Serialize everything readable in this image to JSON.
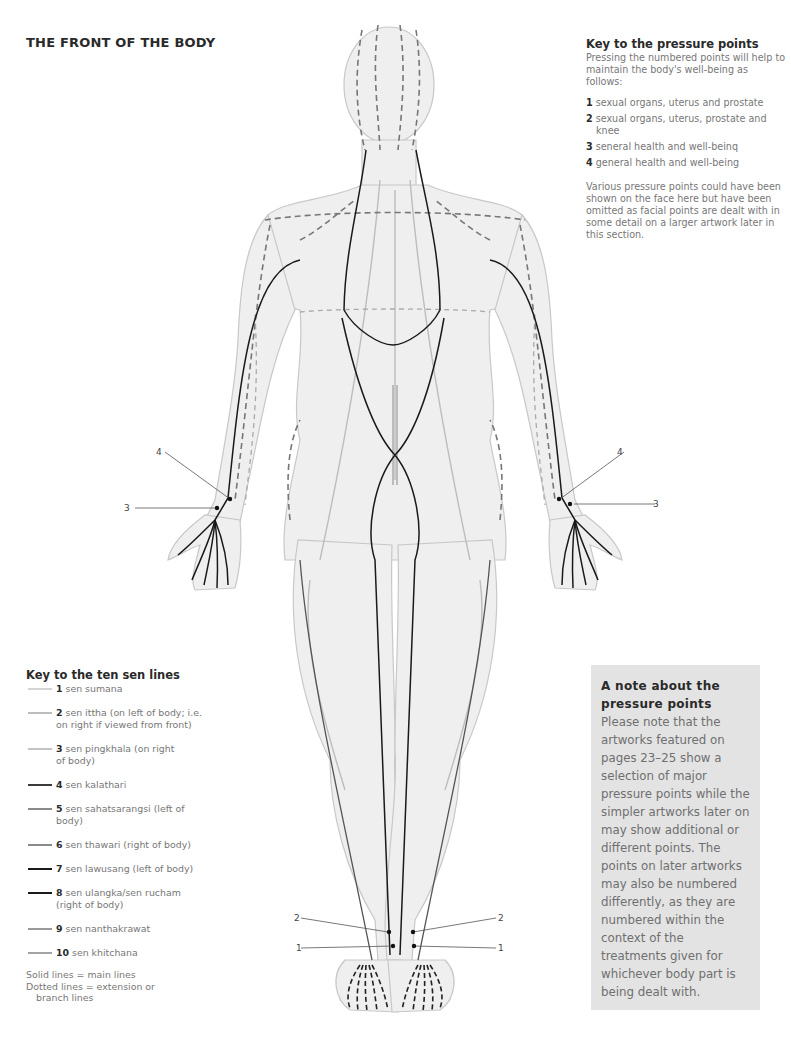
{
  "page": {
    "title": "THE FRONT OF THE BODY"
  },
  "pressure_points_key": {
    "heading": "Key to the pressure points",
    "intro": "Pressing the numbered points will help to maintain the body's well-being as follows:",
    "items": [
      {
        "number": "1",
        "text": "sexual organs, uterus and prostate"
      },
      {
        "number": "2",
        "text": "sexual organs, uterus, prostate and knee"
      },
      {
        "number": "3",
        "text": "seneral health and well-beinq"
      },
      {
        "number": "4",
        "text": "general health and well-being"
      }
    ],
    "note": "Various pressure points could have been shown on the face here but have been omitted as facial points are dealt with in some detail on a larger artwork later in this section."
  },
  "sen_lines_key": {
    "heading": "Key to the ten sen lines",
    "items": [
      {
        "number": "1",
        "text": "sen sumana",
        "color": "#d4d4d4"
      },
      {
        "number": "2",
        "text": "sen ittha (on left of body; i.e. on right if viewed from front)",
        "color": "#bdbdbd"
      },
      {
        "number": "3",
        "text": "sen pingkhala (on right of body)",
        "color": "#c4c4c4"
      },
      {
        "number": "4",
        "text": "sen kalathari",
        "color": "#3a3a3a"
      },
      {
        "number": "5",
        "text": "sen sahatsarangsi (left of body)",
        "color": "#8a8a8a"
      },
      {
        "number": "6",
        "text": "sen thawari (right of body)",
        "color": "#8a8a8a"
      },
      {
        "number": "7",
        "text": "sen lawusang (left of body)",
        "color": "#1a1a1a"
      },
      {
        "number": "8",
        "text": "sen ulangka/sen rucham (right of body)",
        "color": "#1a1a1a"
      },
      {
        "number": "9",
        "text": "sen nanthakrawat",
        "color": "#9a9a9a"
      },
      {
        "number": "10",
        "text": "sen khitchana",
        "color": "#a4a4a4"
      }
    ],
    "footnote_solid": "Solid lines = main lines",
    "footnote_dotted": "Dotted lines = extension or",
    "footnote_dotted_cont": "branch lines"
  },
  "note_box": {
    "heading": "A note about the pressure points",
    "body": "Please note that the artworks featured on pages 23–25 show a selection of major pressure points while the simpler artworks later on may show additional or different points. The points on later artworks may also be numbered differently, as they are numbered within the context of the treatments given for whichever body part is being dealt with."
  },
  "figure": {
    "callouts": [
      {
        "id": "left-wrist-4",
        "label": "4"
      },
      {
        "id": "left-wrist-3",
        "label": "3"
      },
      {
        "id": "right-wrist-4",
        "label": "4"
      },
      {
        "id": "right-wrist-3",
        "label": "3"
      },
      {
        "id": "left-ankle-2",
        "label": "2"
      },
      {
        "id": "left-ankle-1",
        "label": "1"
      },
      {
        "id": "right-ankle-2",
        "label": "2"
      },
      {
        "id": "right-ankle-1",
        "label": "1"
      }
    ]
  }
}
